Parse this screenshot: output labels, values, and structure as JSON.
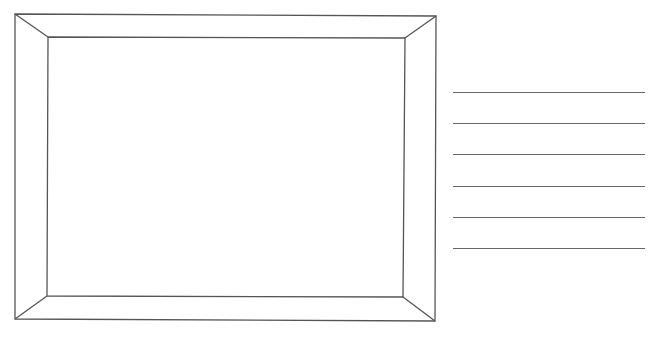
{
  "diagram": {
    "colors": {
      "stroke": "#555555",
      "background": "#ffffff",
      "lines": "#666666"
    },
    "frame": {
      "outer": {
        "tl": [
          15,
          14
        ],
        "tr": [
          436,
          16
        ],
        "br": [
          435,
          321
        ],
        "bl": [
          15,
          319
        ]
      },
      "inner": {
        "tl": [
          48,
          37
        ],
        "tr": [
          405,
          38
        ],
        "br": [
          403,
          297
        ],
        "bl": [
          47,
          296
        ]
      }
    },
    "writing_lines": {
      "x_start": 453,
      "x_end": 645,
      "y_positions": [
        92,
        123,
        154,
        186,
        217,
        248
      ]
    }
  }
}
